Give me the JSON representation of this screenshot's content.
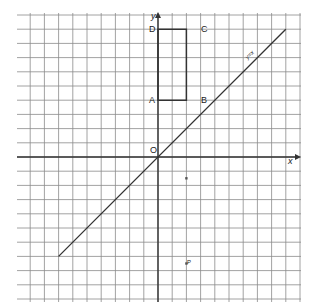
{
  "diagram": {
    "type": "coordinate-grid",
    "grid": {
      "left": 17,
      "top": 13,
      "right": 301,
      "bottom": 302,
      "spacing": 14.2,
      "color": "#8a8a8a"
    },
    "origin_px": [
      158,
      157
    ],
    "axes": {
      "x_label": "x",
      "y_label": "y",
      "origin_label": "O",
      "color": "#333333"
    },
    "rectangle": {
      "vertices": [
        {
          "label": "A",
          "x": 0,
          "y": 4
        },
        {
          "label": "B",
          "x": 2,
          "y": 4
        },
        {
          "label": "C",
          "x": 2,
          "y": 9
        },
        {
          "label": "D",
          "x": 0,
          "y": 9
        }
      ],
      "color": "#333333"
    },
    "line": {
      "label": "y=x",
      "from": [
        -7,
        -7
      ],
      "to": [
        9,
        9
      ],
      "color": "#333333"
    },
    "points": [
      {
        "label": "P",
        "x": 2,
        "y": -7.5
      },
      {
        "label": "",
        "x": 2,
        "y": -1.5
      }
    ]
  }
}
